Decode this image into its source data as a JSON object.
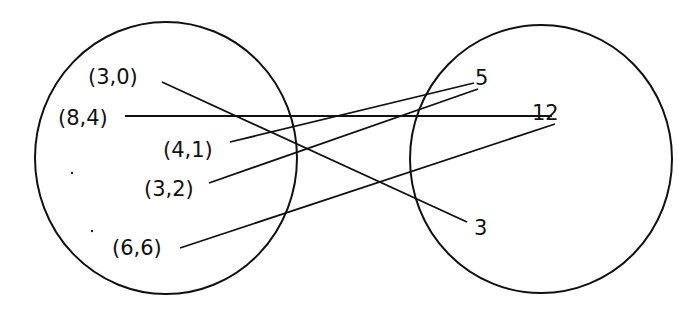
{
  "diagram": {
    "type": "mapping-diagram",
    "domain_set": {
      "elements": [
        {
          "label": "(3,0)",
          "x": 88,
          "y": 67
        },
        {
          "label": "(8,4)",
          "x": 58,
          "y": 108
        },
        {
          "label": "(4,1)",
          "x": 163,
          "y": 140
        },
        {
          "label": "(3,2)",
          "x": 144,
          "y": 179
        },
        {
          "label": "(6,6)",
          "x": 112,
          "y": 238
        }
      ]
    },
    "codomain_set": {
      "elements": [
        {
          "label": "5",
          "x": 475,
          "y": 68
        },
        {
          "label": "12",
          "x": 532,
          "y": 103
        },
        {
          "label": "3",
          "x": 474,
          "y": 218
        }
      ]
    },
    "mappings": [
      {
        "from": "(3,0)",
        "to": "3",
        "x1": 162,
        "y1": 82,
        "x2": 467,
        "y2": 222
      },
      {
        "from": "(8,4)",
        "to": "12",
        "x1": 125,
        "y1": 116,
        "x2": 552,
        "y2": 116
      },
      {
        "from": "(4,1)",
        "to": "5",
        "x1": 230,
        "y1": 142,
        "x2": 474,
        "y2": 83
      },
      {
        "from": "(3,2)",
        "to": "5",
        "x1": 209,
        "y1": 183,
        "x2": 478,
        "y2": 89
      },
      {
        "from": "(6,6)",
        "to": "12",
        "x1": 180,
        "y1": 248,
        "x2": 555,
        "y2": 124
      }
    ]
  }
}
